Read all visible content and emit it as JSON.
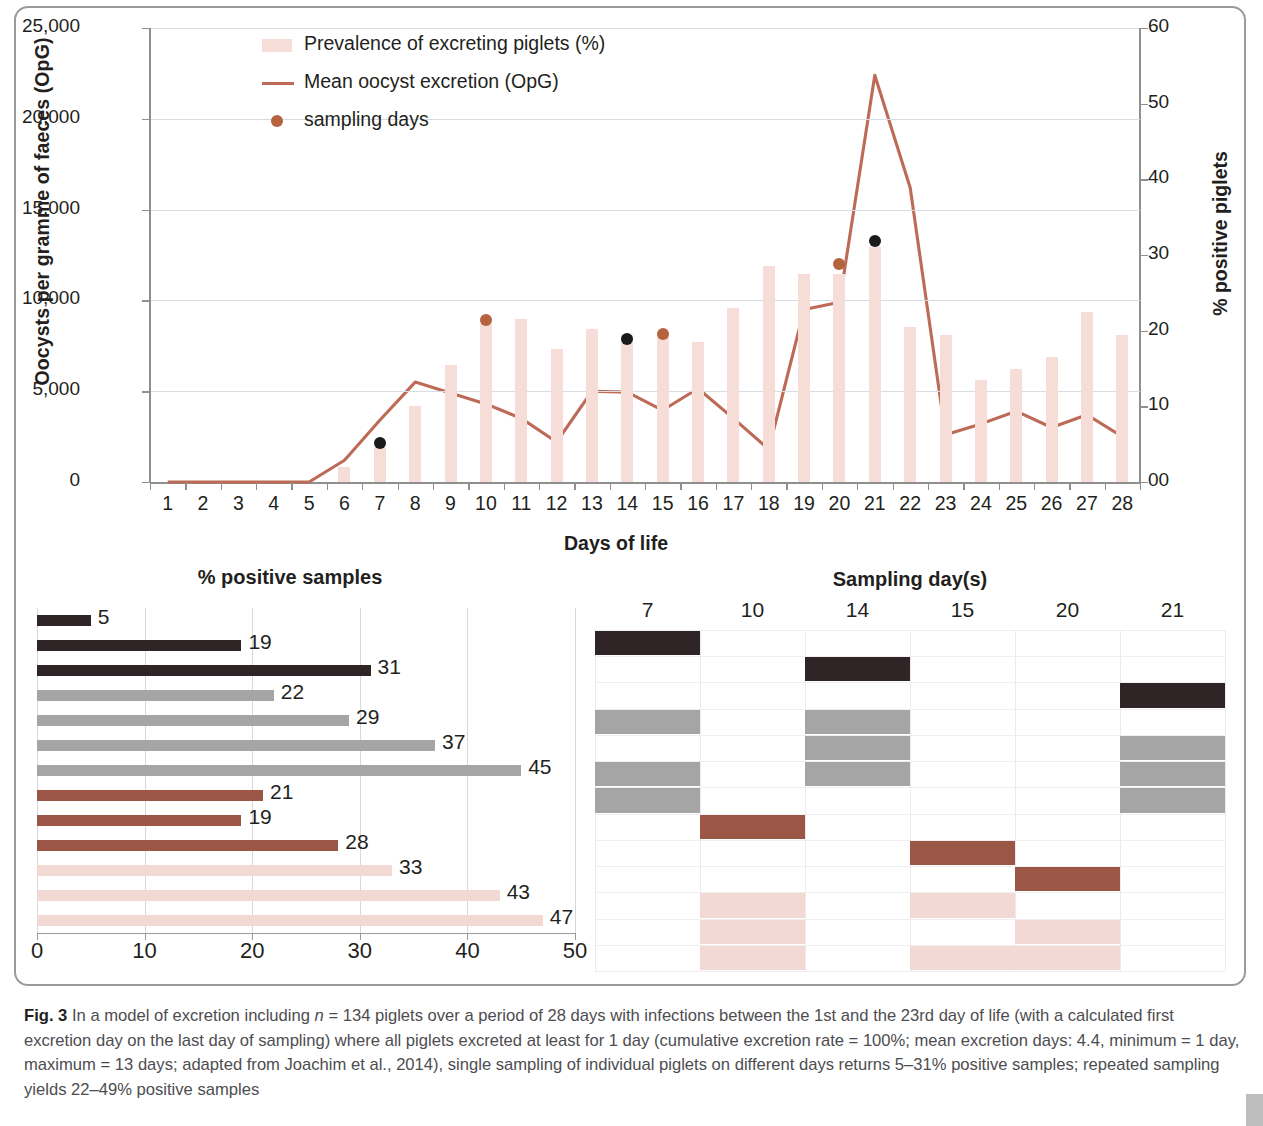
{
  "figure": {
    "label": "Fig. 3",
    "caption": "In a model of excretion including n = 134 piglets over a period of 28 days with infections between the 1st and the 23rd day of life (with a calculated first excretion day on the last day of sampling) where all piglets excreted at least for 1 day (cumulative excretion rate = 100%; mean excretion days: 4.4, minimum = 1 day, maximum = 13 days; adapted from Joachim et al., 2014), single sampling of individual piglets on different days returns 5–31% positive samples; repeated sampling yields 22–49% positive samples"
  },
  "colors": {
    "bar_pink": "#f7ddd7",
    "line_brown": "#bd6a57",
    "dot_brown": "#b5623f",
    "dot_black": "#1a1a1a",
    "hbar_black": "#2f2526",
    "hbar_gray": "#a5a5a5",
    "hbar_darkred": "#9c5646",
    "hbar_lightpink": "#f3d9d4",
    "gridline": "#d6dde4",
    "axis": "#8f8f8f",
    "caption_text": "#4d4d4f"
  },
  "chart_data": [
    {
      "type": "bar",
      "id": "excretion-combo",
      "title": "",
      "xlabel": "Days of life",
      "ylabel": "Oocysts per gramme of faeces (OpG)",
      "y2label": "% positive piglets",
      "ylim": [
        0,
        25000
      ],
      "yticks": [
        0,
        5000,
        10000,
        15000,
        20000,
        25000
      ],
      "ytick_labels": [
        "0",
        "5,000",
        "10,000",
        "15,000",
        "20,000",
        "25,000"
      ],
      "y2lim": [
        0,
        60
      ],
      "y2ticks": [
        0,
        10,
        20,
        30,
        40,
        50,
        60
      ],
      "y2tick_labels": [
        "00",
        "10",
        "20",
        "30",
        "40",
        "50",
        "60"
      ],
      "grid": true,
      "legend_position": "upper-left-inside",
      "categories": [
        1,
        2,
        3,
        4,
        5,
        6,
        7,
        8,
        9,
        10,
        11,
        12,
        13,
        14,
        15,
        16,
        17,
        18,
        19,
        20,
        21,
        22,
        23,
        24,
        25,
        26,
        27,
        28
      ],
      "series": [
        {
          "name": "Prevalence of excreting piglets (%)",
          "kind": "bar",
          "axis": "right",
          "color": "#f7ddd7",
          "values_percent": [
            0,
            0,
            0,
            0,
            0,
            2,
            5,
            10,
            15.5,
            21,
            21.5,
            17.5,
            20,
            19.5,
            19.5,
            18.5,
            23,
            28.5,
            27.5,
            27.5,
            31,
            20.5,
            19.5,
            13.5,
            15,
            16.5,
            22.5,
            19.5
          ],
          "values_opg_scale": [
            0,
            0,
            0,
            0,
            0,
            830,
            2080,
            4170,
            6460,
            8750,
            9000,
            7300,
            8450,
            8120,
            8120,
            7710,
            9580,
            11880,
            11460,
            11460,
            12920,
            8540,
            8120,
            5620,
            6250,
            6870,
            9370,
            8120
          ]
        },
        {
          "name": "Mean oocyst excretion (OpG)",
          "kind": "line",
          "axis": "left",
          "color": "#bd6a57",
          "values": [
            0,
            0,
            0,
            0,
            0,
            1200,
            3400,
            5500,
            4900,
            4300,
            3500,
            2200,
            5000,
            4950,
            3950,
            5150,
            3500,
            1800,
            9500,
            9900,
            22400,
            16200,
            2600,
            3200,
            3900,
            3000,
            3700,
            2500
          ]
        },
        {
          "name": "sampling days",
          "kind": "scatter",
          "axis": "left",
          "color_black": "#1a1a1a",
          "color_brown": "#b5623f",
          "points": [
            {
              "day": 7,
              "value": 2150,
              "color": "black"
            },
            {
              "day": 10,
              "value": 8900,
              "color": "brown"
            },
            {
              "day": 14,
              "value": 7900,
              "color": "black"
            },
            {
              "day": 15,
              "value": 8150,
              "color": "brown"
            },
            {
              "day": 20,
              "value": 12000,
              "color": "brown"
            },
            {
              "day": 21,
              "value": 13250,
              "color": "black"
            }
          ]
        }
      ]
    },
    {
      "type": "bar",
      "id": "positive-samples",
      "orientation": "horizontal",
      "title": "% positive samples",
      "xlabel": "",
      "xlim": [
        0,
        50
      ],
      "xticks": [
        0,
        10,
        20,
        30,
        40,
        50
      ],
      "xtick_labels": [
        "0",
        "10",
        "20",
        "30",
        "40",
        "50"
      ],
      "grid": true,
      "values": [
        5,
        19,
        31,
        22,
        29,
        37,
        45,
        21,
        19,
        28,
        33,
        43,
        47
      ],
      "bar_colors": [
        "#2f2526",
        "#2f2526",
        "#2f2526",
        "#a5a5a5",
        "#a5a5a5",
        "#a5a5a5",
        "#a5a5a5",
        "#9c5646",
        "#9c5646",
        "#9c5646",
        "#f3d9d4",
        "#f3d9d4",
        "#f3d9d4"
      ],
      "labels": [
        "5",
        "19",
        "31",
        "22",
        "29",
        "37",
        "45",
        "21",
        "19",
        "28",
        "33",
        "43",
        "47"
      ]
    },
    {
      "type": "heatmap",
      "id": "sampling-day-matrix",
      "title": "Sampling day(s)",
      "columns": [
        "7",
        "10",
        "14",
        "15",
        "20",
        "21"
      ],
      "row_count": 13,
      "note": "Each row matches a bar of the % positive samples chart; a filled cell marks the sampling day(s) used for that scenario.",
      "cells": [
        {
          "row": 0,
          "col": 0,
          "color": "#2f2526"
        },
        {
          "row": 1,
          "col": 2,
          "color": "#2f2526"
        },
        {
          "row": 2,
          "col": 5,
          "color": "#2f2526"
        },
        {
          "row": 3,
          "col": 0,
          "color": "#a5a5a5"
        },
        {
          "row": 3,
          "col": 2,
          "color": "#a5a5a5"
        },
        {
          "row": 4,
          "col": 2,
          "color": "#a5a5a5"
        },
        {
          "row": 4,
          "col": 5,
          "color": "#a5a5a5"
        },
        {
          "row": 5,
          "col": 0,
          "color": "#a5a5a5"
        },
        {
          "row": 5,
          "col": 2,
          "color": "#a5a5a5"
        },
        {
          "row": 5,
          "col": 5,
          "color": "#a5a5a5"
        },
        {
          "row": 6,
          "col": 0,
          "color": "#a5a5a5"
        },
        {
          "row": 6,
          "col": 5,
          "color": "#a5a5a5"
        },
        {
          "row": 7,
          "col": 1,
          "color": "#9c5646"
        },
        {
          "row": 8,
          "col": 3,
          "color": "#9c5646"
        },
        {
          "row": 9,
          "col": 4,
          "color": "#9c5646"
        },
        {
          "row": 10,
          "col": 1,
          "color": "#f3d9d4"
        },
        {
          "row": 10,
          "col": 3,
          "color": "#f3d9d4"
        },
        {
          "row": 11,
          "col": 1,
          "color": "#f3d9d4"
        },
        {
          "row": 11,
          "col": 4,
          "color": "#f3d9d4"
        },
        {
          "row": 12,
          "col": 1,
          "color": "#f3d9d4"
        },
        {
          "row": 12,
          "col": 3,
          "color": "#f3d9d4"
        },
        {
          "row": 12,
          "col": 4,
          "color": "#f3d9d4"
        }
      ]
    }
  ]
}
